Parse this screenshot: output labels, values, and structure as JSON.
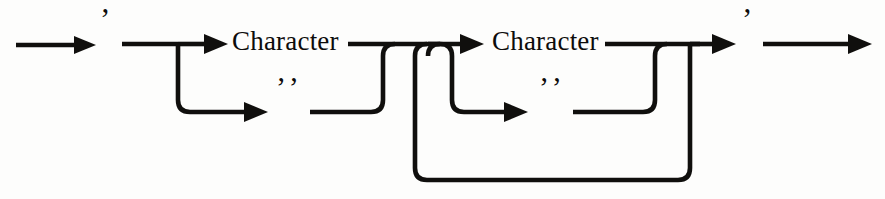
{
  "diagram": {
    "type": "railroad-syntax-diagram",
    "ink_color": "#100f0d",
    "background_color": "#fdfdfc",
    "labels": {
      "open_quote": "’",
      "close_quote": "’",
      "character_1": "Character",
      "character_2": "Character",
      "escaped_quote_1": "’’",
      "escaped_quote_2": "’’"
    },
    "nodes": [
      {
        "name": "entry-arrow",
        "kind": "arrow",
        "direction": "right"
      },
      {
        "name": "open-quote-terminal",
        "kind": "terminal",
        "text": "’"
      },
      {
        "name": "character-nonterminal-1",
        "kind": "nonterminal",
        "text": "Character"
      },
      {
        "name": "escaped-quote-terminal-1",
        "kind": "terminal",
        "text": "’’"
      },
      {
        "name": "character-nonterminal-2",
        "kind": "nonterminal",
        "text": "Character"
      },
      {
        "name": "escaped-quote-terminal-2",
        "kind": "terminal",
        "text": "’’"
      },
      {
        "name": "close-quote-terminal",
        "kind": "terminal",
        "text": "’"
      },
      {
        "name": "exit-arrow",
        "kind": "arrow",
        "direction": "right"
      }
    ],
    "branches": [
      {
        "name": "first-alternation",
        "options": [
          "Character",
          "’’"
        ]
      },
      {
        "name": "second-alternation",
        "options": [
          "Character",
          "’’"
        ]
      },
      {
        "name": "repeat-loop",
        "loops_back": true
      }
    ]
  }
}
